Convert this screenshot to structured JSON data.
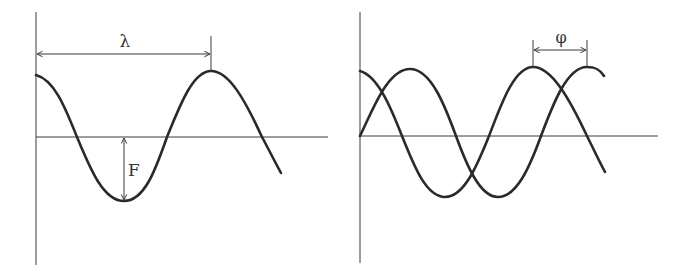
{
  "diagram": {
    "left_panel": {
      "title": "wave-wavelength-amplitude",
      "wavelength_label": "λ",
      "amplitude_label": "F"
    },
    "right_panel": {
      "title": "two-waves-phase-shift",
      "phase_label": "φ"
    },
    "colors": {
      "wave": "#2a2a2a",
      "axis": "#3a3a3a",
      "label": "#333333",
      "background": "#ffffff"
    }
  }
}
